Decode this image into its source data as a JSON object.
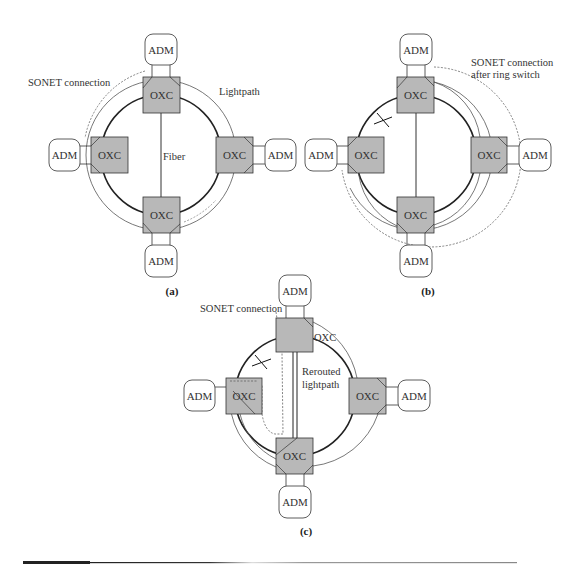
{
  "figure": {
    "panels": [
      {
        "id": "a",
        "caption": "(a)",
        "labels": {
          "sonet": "SONET connection",
          "lightpath": "Lightpath",
          "fiber": "Fiber"
        }
      },
      {
        "id": "b",
        "caption": "(b)",
        "labels": {
          "sonet_line1": "SONET connection",
          "sonet_line2": "after ring switch"
        }
      },
      {
        "id": "c",
        "caption": "(c)",
        "labels": {
          "sonet": "SONET connection",
          "rerouted_line1": "Rerouted",
          "rerouted_line2": "lightpath",
          "oxc_top": "OXC"
        }
      }
    ],
    "node_labels": {
      "oxc": "OXC",
      "adm": "ADM"
    },
    "colors": {
      "oxc_fill": "#b8b8b8",
      "stroke": "#333333",
      "fiber": "#222222",
      "lightpath": "#555555",
      "sonet_dotted": "#666666",
      "rule_dark": "#222222",
      "rule_light": "#999999"
    }
  }
}
